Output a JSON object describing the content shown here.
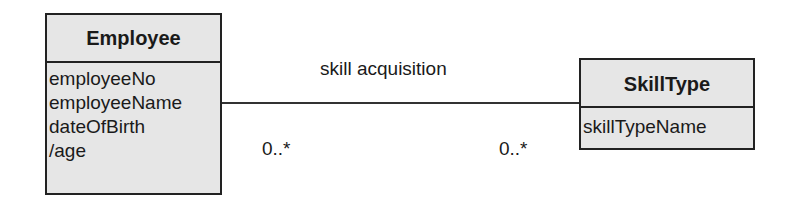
{
  "diagram": {
    "type": "uml-class-diagram",
    "classes": [
      {
        "name": "Employee",
        "attributes": [
          "employeeNo",
          "employeeName",
          "dateOfBirth",
          "/age"
        ]
      },
      {
        "name": "SkillType",
        "attributes": [
          "skillTypeName"
        ]
      }
    ],
    "association": {
      "name": "skill acquisition",
      "from": "Employee",
      "to": "SkillType",
      "multiplicity_from": "0..*",
      "multiplicity_to": "0..*"
    }
  }
}
